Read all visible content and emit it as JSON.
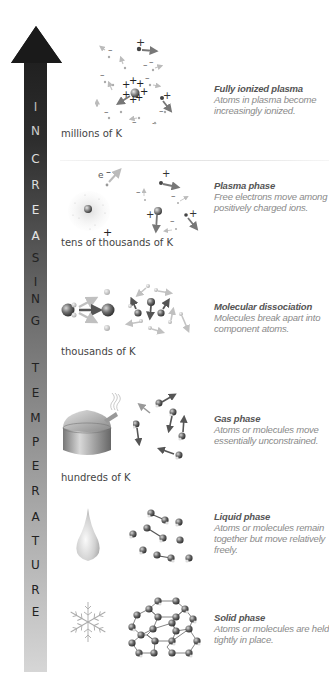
{
  "diagram": {
    "axis": {
      "label": "INCREASING TEMPERATURE",
      "letters": [
        "I",
        "N",
        "C",
        "R",
        "E",
        "A",
        "S",
        "I",
        "N",
        "G",
        "T",
        "E",
        "M",
        "P",
        "E",
        "R",
        "A",
        "T",
        "U",
        "R",
        "E"
      ],
      "direction": "up",
      "colors": {
        "top": "#1a1a1a",
        "middle": "#707070",
        "bottom": "#d4d4d4"
      }
    },
    "phases": [
      {
        "id": "fully-ionized-plasma",
        "title": "Fully ionized plasma",
        "description": "Atoms in plasma become increasingly ionized.",
        "temperature": "millions of K"
      },
      {
        "id": "plasma-phase",
        "title": "Plasma phase",
        "description": "Free electrons move among positively charged ions.",
        "temperature": "tens of thousands of K",
        "electron_label": "e"
      },
      {
        "id": "molecular-dissociation",
        "title": "Molecular dissociation",
        "description": "Molecules break apart into component atoms.",
        "temperature": "thousands of K"
      },
      {
        "id": "gas-phase",
        "title": "Gas phase",
        "description": "Atoms or molecules move essentially unconstrained.",
        "temperature": "hundreds of K"
      },
      {
        "id": "liquid-phase",
        "title": "Liquid phase",
        "description": "Atoms or molecules remain together but move relatively freely.",
        "temperature": ""
      },
      {
        "id": "solid-phase",
        "title": "Solid phase",
        "description": "Atoms or molecules are held tightly in place.",
        "temperature": ""
      }
    ],
    "icons": {
      "plasma-full": "ionized-plasma-icon",
      "plasma": "plasma-atom-icon",
      "dissociation": "molecule-split-icon",
      "gas-source": "boiling-pot-icon",
      "liquid-source": "water-drop-icon",
      "solid-source": "snowflake-icon"
    }
  }
}
